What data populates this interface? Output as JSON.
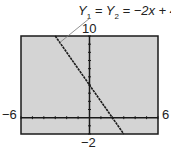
{
  "chart_data": {
    "type": "line",
    "title": "",
    "annotation": {
      "text_parts": [
        "Y",
        "1",
        " = ",
        "Y",
        "2",
        " = −2x + 4"
      ],
      "full_text": "Y1 = Y2 = −2x + 4"
    },
    "xlabel": "",
    "ylabel": "",
    "xlim": [
      -6,
      6
    ],
    "ylim": [
      -2,
      10
    ],
    "tick_labels": {
      "xmin": "−6",
      "xmax": "6",
      "ymin": "−2",
      "ymax": "10"
    },
    "x_tick_step": 1,
    "y_tick_step": 1,
    "grid": false,
    "series": [
      {
        "name": "Y1 = Y2 = -2x + 4",
        "x": [
          -3,
          3
        ],
        "y": [
          10,
          -2
        ],
        "slope": -2,
        "intercept": 4
      }
    ],
    "colors": {
      "background": "#d4d4d4",
      "line": "#1a1a1a",
      "frame": "#1a1a1a"
    }
  }
}
